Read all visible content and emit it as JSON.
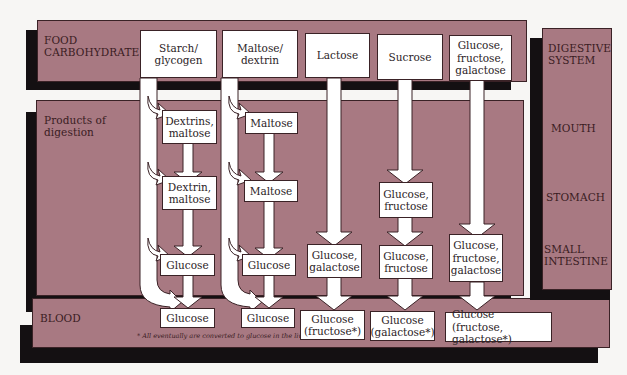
{
  "colors": {
    "band": "#a87982",
    "shadow": "#141012",
    "box": "#ffffff",
    "background": "#f7f6f4"
  },
  "rows": {
    "food": "FOOD\nCARBOHYDRATE",
    "products": "Products of\ndigestion",
    "blood": "BLOOD"
  },
  "digestive_system": {
    "title": "DIGESTIVE\nSYSTEM",
    "mouth": "MOUTH",
    "stomach": "STOMACH",
    "small_intestine": "SMALL\nINTESTINE"
  },
  "columns": [
    {
      "food": "Starch/\nglycogen",
      "mouth": "Dextrins,\nmaltose",
      "stomach": "Dextrin,\nmaltose",
      "intestine": "Glucose",
      "blood": "Glucose"
    },
    {
      "food": "Maltose/\ndextrin",
      "mouth": "Maltose",
      "stomach": "Maltose",
      "intestine": "Glucose",
      "blood": "Glucose"
    },
    {
      "food": "Lactose",
      "intestine": "Glucose,\ngalactose",
      "blood": "Glucose\n(fructose*)"
    },
    {
      "food": "Sucrose",
      "stomach": "Glucose,\nfructose",
      "intestine": "Glucose,\nfructose",
      "blood": "Glucose\n(galactose*)"
    },
    {
      "food": "Glucose,\nfructose,\ngalactose",
      "intestine": "Glucose,\nfructose,\ngalactose",
      "blood": "Glucose\n(fructose, galactose*)"
    }
  ],
  "footnote": "* All eventually are converted to glucose in the liver."
}
